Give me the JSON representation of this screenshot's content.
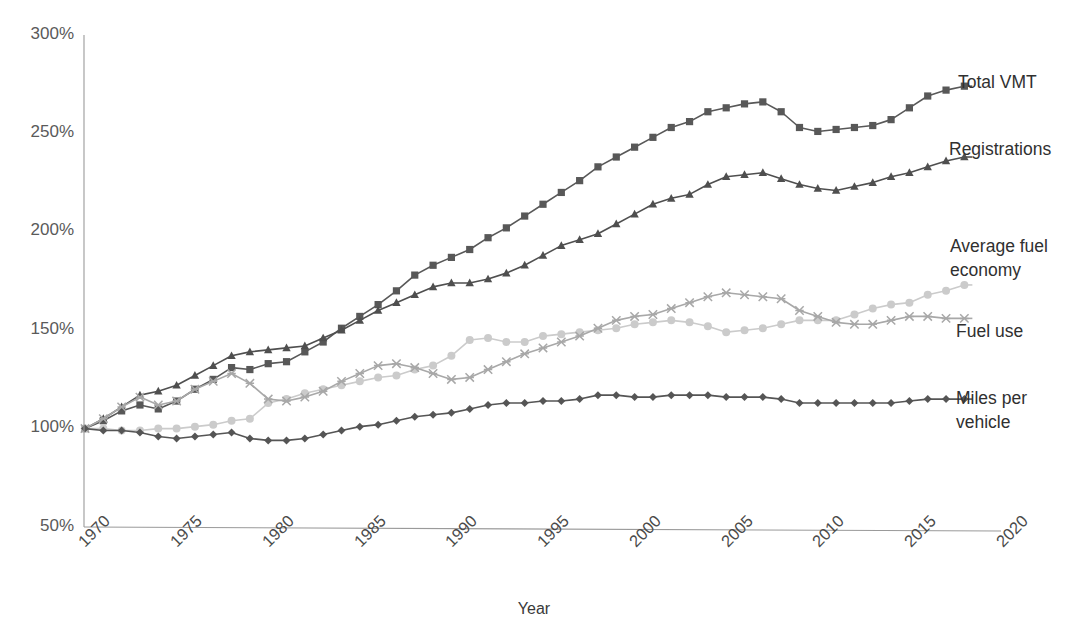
{
  "chart_data": {
    "type": "line",
    "title": "",
    "xlabel": "Year",
    "ylabel": "",
    "xlim": [
      1970,
      2020
    ],
    "ylim": [
      50,
      300
    ],
    "y_unit": "%",
    "grid": false,
    "legend_position": "right-inline-labels",
    "x_tick_labels": [
      "1970",
      "1975",
      "1980",
      "1985",
      "1990",
      "1995",
      "2000",
      "2005",
      "2010",
      "2015",
      "2020"
    ],
    "x_ticks": [
      1970,
      1975,
      1980,
      1985,
      1990,
      1995,
      2000,
      2005,
      2010,
      2015,
      2020
    ],
    "y_tick_labels": [
      "50%",
      "100%",
      "150%",
      "200%",
      "250%",
      "300%"
    ],
    "y_ticks": [
      50,
      100,
      150,
      200,
      250,
      300
    ],
    "x": [
      1970,
      1971,
      1972,
      1973,
      1974,
      1975,
      1976,
      1977,
      1978,
      1979,
      1980,
      1981,
      1982,
      1983,
      1984,
      1985,
      1986,
      1987,
      1988,
      1989,
      1990,
      1991,
      1992,
      1993,
      1994,
      1995,
      1996,
      1997,
      1998,
      1999,
      2000,
      2001,
      2002,
      2003,
      2004,
      2005,
      2006,
      2007,
      2008,
      2009,
      2010,
      2011,
      2012,
      2013,
      2014,
      2015,
      2016,
      2017,
      2018
    ],
    "series": [
      {
        "name": "Total VMT",
        "color": "#585858",
        "marker": "square",
        "values": [
          100,
          104,
          109,
          112,
          110,
          114,
          120,
          125,
          131,
          130,
          133,
          134,
          139,
          144,
          151,
          157,
          163,
          170,
          178,
          183,
          187,
          191,
          197,
          202,
          208,
          214,
          220,
          226,
          233,
          238,
          243,
          248,
          253,
          256,
          261,
          263,
          265,
          266,
          261,
          253,
          251,
          252,
          253,
          254,
          257,
          263,
          269,
          272,
          274
        ],
        "label_text": "Total VMT"
      },
      {
        "name": "Registrations",
        "color": "#4f4f4f",
        "marker": "triangle",
        "values": [
          100,
          105,
          111,
          117,
          119,
          122,
          127,
          132,
          137,
          139,
          140,
          141,
          142,
          146,
          150,
          155,
          160,
          164,
          168,
          172,
          174,
          174,
          176,
          179,
          183,
          188,
          193,
          196,
          199,
          204,
          209,
          214,
          217,
          219,
          224,
          228,
          229,
          230,
          227,
          224,
          222,
          221,
          223,
          225,
          228,
          230,
          233,
          236,
          238
        ],
        "label_text": "Registrations"
      },
      {
        "name": "Average fuel economy",
        "color": "#cbcbcb",
        "marker": "circle",
        "values": [
          100,
          100,
          99,
          99,
          100,
          100,
          101,
          102,
          104,
          105,
          113,
          115,
          118,
          120,
          122,
          124,
          126,
          127,
          130,
          132,
          137,
          145,
          146,
          144,
          144,
          147,
          148,
          149,
          150,
          151,
          153,
          154,
          155,
          154,
          152,
          149,
          150,
          151,
          153,
          155,
          155,
          155,
          158,
          161,
          163,
          164,
          168,
          170,
          173
        ],
        "label_text": "Average fuel economy",
        "label_lines": [
          "Average fuel",
          "economy"
        ]
      },
      {
        "name": "Fuel use",
        "color": "#a8a8a8",
        "marker": "x",
        "values": [
          100,
          105,
          111,
          116,
          112,
          114,
          120,
          124,
          128,
          123,
          115,
          114,
          116,
          119,
          124,
          128,
          132,
          133,
          131,
          128,
          125,
          126,
          130,
          134,
          138,
          141,
          144,
          147,
          151,
          155,
          157,
          158,
          161,
          164,
          167,
          169,
          168,
          167,
          166,
          160,
          157,
          154,
          153,
          153,
          155,
          157,
          157,
          156,
          156
        ],
        "label_text": "Fuel use"
      },
      {
        "name": "Miles per vehicle",
        "color": "#555555",
        "marker": "diamond",
        "values": [
          100,
          99,
          99,
          98,
          96,
          95,
          96,
          97,
          98,
          95,
          94,
          94,
          95,
          97,
          99,
          101,
          102,
          104,
          106,
          107,
          108,
          110,
          112,
          113,
          113,
          114,
          114,
          115,
          117,
          117,
          116,
          116,
          117,
          117,
          117,
          116,
          116,
          116,
          115,
          113,
          113,
          113,
          113,
          113,
          113,
          114,
          115,
          115,
          115
        ],
        "label_text": "Miles per vehicle",
        "label_lines": [
          "Miles per",
          "vehicle"
        ]
      }
    ]
  },
  "axis": {
    "x_title": "Year"
  },
  "labels": {
    "total_vmt": "Total VMT",
    "registrations": "Registrations",
    "avg_fuel_economy_line1": "Average fuel",
    "avg_fuel_economy_line2": "economy",
    "fuel_use": "Fuel use",
    "miles_per_vehicle_line1": "Miles per",
    "miles_per_vehicle_line2": "vehicle"
  },
  "y_labels": {
    "t300": "300%",
    "t250": "250%",
    "t200": "200%",
    "t150": "150%",
    "t100": "100%",
    "t50": "50%"
  },
  "x_labels": {
    "y1970": "1970",
    "y1975": "1975",
    "y1980": "1980",
    "y1985": "1985",
    "y1990": "1990",
    "y1995": "1995",
    "y2000": "2000",
    "y2005": "2005",
    "y2010": "2010",
    "y2015": "2015",
    "y2020": "2020"
  }
}
